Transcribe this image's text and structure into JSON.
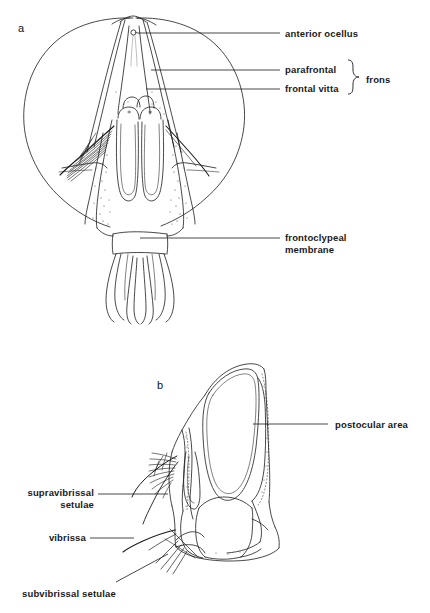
{
  "figure": {
    "type": "scientific-line-drawing",
    "background_color": "#ffffff",
    "line_color": "#1a1a1a",
    "panels": [
      {
        "id": "a",
        "letter": "a",
        "view": "anterior (frontal) view of head",
        "letter_x": 18,
        "letter_y": 22
      },
      {
        "id": "b",
        "letter": "b",
        "view": "lateral view of head",
        "letter_x": 157,
        "letter_y": 379
      }
    ]
  },
  "labels": [
    {
      "id": "anterior-ocellus",
      "text": "anterior ocellus",
      "panel": "a",
      "text_x": 285,
      "text_y": 28,
      "align": "left",
      "leader": {
        "x1": 137,
        "y1": 33,
        "x2": 280,
        "y2": 33
      }
    },
    {
      "id": "parafrontal",
      "text": "parafrontal",
      "panel": "a",
      "text_x": 285,
      "text_y": 64,
      "align": "left",
      "leader": {
        "x1": 151,
        "y1": 70,
        "x2": 280,
        "y2": 70
      }
    },
    {
      "id": "frontal-vitta",
      "text": "frontal vitta",
      "panel": "a",
      "text_x": 285,
      "text_y": 83,
      "align": "left",
      "leader": {
        "x1": 146,
        "y1": 89,
        "x2": 280,
        "y2": 89
      }
    },
    {
      "id": "frons",
      "text": "frons",
      "panel": "a",
      "text_x": 366,
      "text_y": 74,
      "align": "left",
      "bracket": {
        "x": 351,
        "y_top": 61,
        "y_bottom": 94,
        "tip_x": 360
      }
    },
    {
      "id": "frontoclypeal-membrane",
      "text": "frontoclypeal\nmembrane",
      "line1": "frontoclypeal",
      "line2": "membrane",
      "panel": "a",
      "text_x": 285,
      "text_y": 232,
      "align": "left",
      "leader": {
        "x1": 140,
        "y1": 238,
        "x2": 280,
        "y2": 238
      }
    },
    {
      "id": "postocular-area",
      "text": "postocular area",
      "panel": "b",
      "text_x": 335,
      "text_y": 419,
      "align": "left",
      "leader": {
        "x1": 253,
        "y1": 424,
        "x2": 328,
        "y2": 424
      }
    },
    {
      "id": "supravibrissal-setulae",
      "text": "supravibrissal\nsetulae",
      "line1": "supravibrissal",
      "line2": "setulae",
      "panel": "b",
      "text_x": 12,
      "text_y": 487,
      "align": "right",
      "leader": {
        "x1": 98,
        "y1": 494,
        "x2": 165,
        "y2": 494
      }
    },
    {
      "id": "vibrissa",
      "text": "vibrissa",
      "panel": "b",
      "text_x": 36,
      "text_y": 532,
      "align": "right",
      "leader": {
        "x1": 90,
        "y1": 538,
        "x2": 132,
        "y2": 538
      }
    },
    {
      "id": "subvibrissal-setulae",
      "text": "subvibrissal setulae",
      "panel": "b",
      "text_x": 22,
      "text_y": 588,
      "align": "left",
      "leader": {
        "x1": 118,
        "y1": 583,
        "x2": 165,
        "y2": 556
      }
    }
  ]
}
